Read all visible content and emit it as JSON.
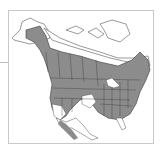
{
  "map": {
    "title": "",
    "region": "North America",
    "range_color": "#8c8c8c",
    "land_color": "#ffffff",
    "border_color": "#3a3a3a",
    "frame_color": "#c8c8c8"
  }
}
